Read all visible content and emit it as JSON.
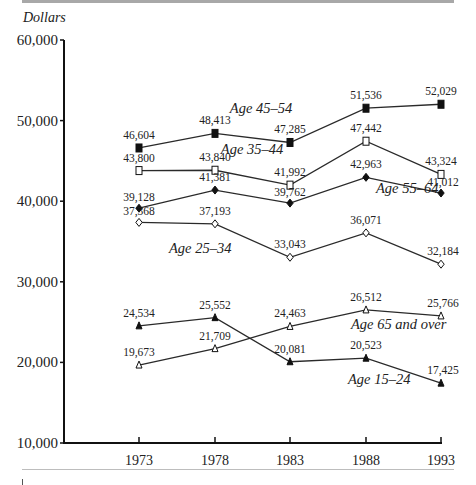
{
  "chart_data": {
    "type": "line",
    "title": "",
    "xlabel": "",
    "ylabel": "Dollars",
    "ylim": [
      10000,
      60000
    ],
    "yticks": [
      10000,
      20000,
      30000,
      40000,
      50000,
      60000
    ],
    "ytick_labels": [
      "10,000",
      "20,000",
      "30,000",
      "40,000",
      "50,000",
      "60,000"
    ],
    "categories": [
      "1973",
      "1978",
      "1983",
      "1988",
      "1993"
    ],
    "grid": false,
    "legend": "inline labels",
    "series": [
      {
        "name": "Age 45–54",
        "marker": "filled-square",
        "values": [
          46604,
          48413,
          47285,
          51536,
          52029
        ],
        "labels": [
          "46,604",
          "48,413",
          "47,285",
          "51,536",
          "52,029"
        ]
      },
      {
        "name": "Age 35–44",
        "marker": "open-square",
        "values": [
          43800,
          43840,
          41992,
          47442,
          43324
        ],
        "labels": [
          "43,800",
          "43,840",
          "41,992",
          "47,442",
          "43,324"
        ]
      },
      {
        "name": "Age 55–64",
        "marker": "filled-diamond",
        "values": [
          39128,
          41381,
          39762,
          42963,
          41012
        ],
        "labels": [
          "39,128",
          "41,381",
          "39,762",
          "42,963",
          "41,012"
        ]
      },
      {
        "name": "Age 25–34",
        "marker": "open-diamond",
        "values": [
          37368,
          37193,
          33043,
          36071,
          32184
        ],
        "labels": [
          "37,368",
          "37,193",
          "33,043",
          "36,071",
          "32,184"
        ]
      },
      {
        "name": "Age 65 and over",
        "marker": "open-triangle",
        "values": [
          19673,
          21709,
          24463,
          26512,
          25766
        ],
        "labels": [
          "19,673",
          "21,709",
          "24,463",
          "26,512",
          "25,766"
        ]
      },
      {
        "name": "Age 15–24",
        "marker": "filled-triangle",
        "values": [
          24534,
          25552,
          20081,
          20523,
          17425
        ],
        "labels": [
          "24,534",
          "25,552",
          "20,081",
          "20,523",
          "17,425"
        ]
      }
    ]
  }
}
